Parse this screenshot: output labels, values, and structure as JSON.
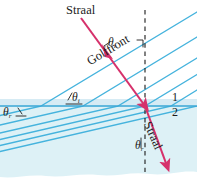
{
  "figure": {
    "width": 197,
    "height": 185,
    "colors": {
      "background_top": "#ffffff",
      "medium2_fill": "#d9f0f5",
      "interface_band": "#cfe9f2",
      "wavefront_line": "#45b3dd",
      "interface_line": "#3aa7d6",
      "ray": "#d6316b",
      "normal_dashed": "#1b1b1b",
      "text": "#1b1b1b"
    }
  },
  "labels": {
    "incident_ray": "Straal",
    "refracted_ray": "Straal",
    "wavefront": "Golffront",
    "theta_symbol": "θ",
    "theta_i_top": {
      "symbol": "θ",
      "subscript": "i"
    },
    "theta_i_lower": {
      "symbol": "θ",
      "subscript": "i"
    },
    "theta_r_left": {
      "symbol": "θ",
      "subscript": "r"
    },
    "theta_r_bottom": {
      "symbol": "θ",
      "subscript": "r"
    },
    "medium_1": "1",
    "medium_2": "2"
  },
  "geometry": {
    "interface_y": 106,
    "incidence_point": {
      "x": 145,
      "y": 106
    },
    "normal_x": 145,
    "incident_angle_deg": 31,
    "refracted_angle_deg": 24,
    "incident_wavefront_tilt_deg": -31,
    "refracted_wavefront_tilt_deg": -13
  }
}
